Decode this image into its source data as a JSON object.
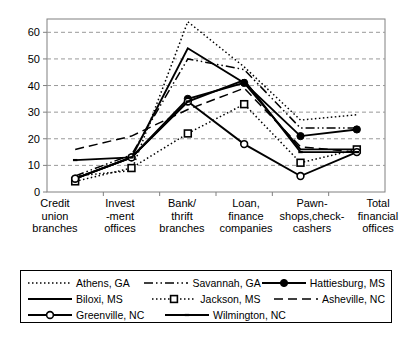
{
  "chart_data": {
    "type": "line",
    "title": "",
    "xlabel": "",
    "ylabel": "",
    "ylim": [
      0,
      65
    ],
    "yticks": [
      0,
      10,
      20,
      30,
      40,
      50,
      60
    ],
    "grid": true,
    "legend_position": "bottom",
    "categories": [
      "Credit\nunion\nbranches",
      "Invest\n-ment\noffices",
      "Bank/\nthrift\nbranches",
      "Loan,\nfinance\ncompanies",
      "Pawn-\nshops,check-\ncashers",
      "Total\nfinancial\noffices"
    ],
    "series": [
      {
        "name": "Athens, GA",
        "style": "dotted",
        "marker": "none",
        "values": [
          6,
          8,
          64,
          47,
          27,
          29
        ]
      },
      {
        "name": "Savannah, GA",
        "style": "dash-dot-dot",
        "marker": "none",
        "values": [
          6,
          14,
          50,
          46,
          24,
          24
        ]
      },
      {
        "name": "Hattiesburg, MS",
        "style": "solid",
        "marker": "filled-circle",
        "values": [
          5,
          13,
          35,
          41,
          21,
          23.5
        ]
      },
      {
        "name": "Biloxi, MS",
        "style": "solid",
        "marker": "none",
        "values": [
          5,
          13,
          54,
          41,
          16,
          16
        ]
      },
      {
        "name": "Jackson, MS",
        "style": "dotted",
        "marker": "open-square",
        "values": [
          4,
          9,
          22,
          33,
          11,
          16
        ]
      },
      {
        "name": "Asheville, NC",
        "style": "long-dash",
        "marker": "none",
        "values": [
          16,
          21,
          31,
          39,
          17,
          15
        ]
      },
      {
        "name": "Greenville, NC",
        "style": "solid",
        "marker": "open-circle",
        "values": [
          5,
          13,
          34,
          18,
          6,
          15
        ]
      },
      {
        "name": "Wilmington, NC",
        "style": "solid",
        "marker": "small-dash",
        "values": [
          12,
          13,
          34,
          42,
          15,
          15
        ]
      }
    ]
  },
  "legend": {
    "rows": [
      [
        {
          "label": "Athens, GA",
          "style": "dotted"
        },
        {
          "label": "Savannah, GA",
          "style": "dash-dot-dot"
        },
        {
          "label": "Hattiesburg, MS",
          "style": "solid-filled-circle"
        }
      ],
      [
        {
          "label": "Biloxi, MS",
          "style": "solid"
        },
        {
          "label": "Jackson, MS",
          "style": "dotted-open-square"
        },
        {
          "label": "Asheville, NC",
          "style": "long-dash"
        }
      ],
      [
        {
          "label": "Greenville, NC",
          "style": "solid-open-circle"
        },
        {
          "label": "Wilmington, NC",
          "style": "solid-small-marker"
        }
      ]
    ]
  },
  "axes": {
    "ytick_labels": [
      "0",
      "10",
      "20",
      "30",
      "40",
      "50",
      "60"
    ]
  },
  "colors": {
    "line": "#000000",
    "grid": "#999999",
    "axis": "#808080",
    "background": "#ffffff"
  }
}
